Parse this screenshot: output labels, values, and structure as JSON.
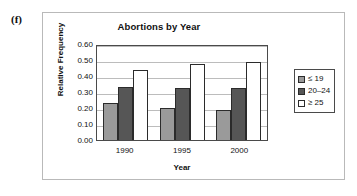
{
  "figure": {
    "part_label": "(f)"
  },
  "chart_data": {
    "type": "bar",
    "title": "Abortions by Year",
    "xlabel": "Year",
    "ylabel": "Relative Frequency",
    "categories": [
      "1990",
      "1995",
      "2000"
    ],
    "series": [
      {
        "name": "≤ 19",
        "values": [
          0.23,
          0.2,
          0.185
        ],
        "color": "#9a9a9a"
      },
      {
        "name": "20–24",
        "values": [
          0.33,
          0.325,
          0.325
        ],
        "color": "#565656"
      },
      {
        "name": "≥ 25",
        "values": [
          0.44,
          0.475,
          0.49
        ],
        "color": "#ffffff"
      }
    ],
    "ylim": [
      0.0,
      0.6
    ],
    "ytick_labels": [
      "0.60",
      "0.50",
      "0.40",
      "0.30",
      "0.20",
      "0.10",
      "0.00"
    ],
    "ytick_values": [
      0.6,
      0.5,
      0.4,
      0.3,
      0.2,
      0.1,
      0.0
    ],
    "grid": true,
    "legend_position": "right",
    "legend_entries": [
      "≤ 19",
      "20–24",
      "≥ 25"
    ]
  },
  "colors": {
    "frame_border": "#b9b9b9",
    "plot_border": "#4a4a4a",
    "gridline": "#bcbcbc",
    "bar_outline": "#2b2b2b",
    "text": "#111111"
  }
}
